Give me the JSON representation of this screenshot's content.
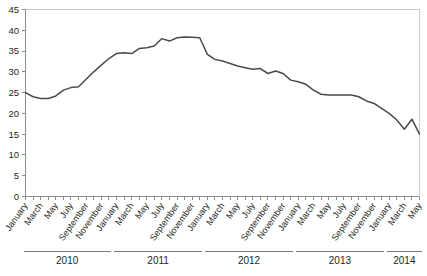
{
  "chart_data": {
    "type": "line",
    "title": "",
    "subtitle": "",
    "xlabel": "",
    "ylabel": "",
    "ylim": [
      0,
      45
    ],
    "grid": false,
    "legend": null,
    "line_color": "#4a4a4a",
    "axis_color": "#8d8d8d",
    "y_ticks": [
      0,
      5,
      10,
      15,
      20,
      25,
      30,
      35,
      40,
      45
    ],
    "x_tick_labels": [
      "January",
      "March",
      "May",
      "July",
      "September",
      "November",
      "January",
      "March",
      "May",
      "July",
      "September",
      "November",
      "January",
      "March",
      "May",
      "July",
      "September",
      "November",
      "January",
      "March",
      "May",
      "July",
      "September",
      "November",
      "January",
      "March",
      "May"
    ],
    "year_groups": [
      {
        "label": "2010",
        "start_index": 0,
        "end_index": 11
      },
      {
        "label": "2011",
        "start_index": 12,
        "end_index": 23
      },
      {
        "label": "2012",
        "start_index": 24,
        "end_index": 35
      },
      {
        "label": "2013",
        "start_index": 36,
        "end_index": 47
      },
      {
        "label": "2014",
        "start_index": 48,
        "end_index": 52
      }
    ],
    "x": [
      "2010-01",
      "2010-02",
      "2010-03",
      "2010-04",
      "2010-05",
      "2010-06",
      "2010-07",
      "2010-08",
      "2010-09",
      "2010-10",
      "2010-11",
      "2010-12",
      "2011-01",
      "2011-02",
      "2011-03",
      "2011-04",
      "2011-05",
      "2011-06",
      "2011-07",
      "2011-08",
      "2011-09",
      "2011-10",
      "2011-11",
      "2011-12",
      "2012-01",
      "2012-02",
      "2012-03",
      "2012-04",
      "2012-05",
      "2012-06",
      "2012-07",
      "2012-08",
      "2012-09",
      "2012-10",
      "2012-11",
      "2012-12",
      "2013-01",
      "2013-02",
      "2013-03",
      "2013-04",
      "2013-05",
      "2013-06",
      "2013-07",
      "2013-08",
      "2013-09",
      "2013-10",
      "2013-11",
      "2013-12",
      "2014-01",
      "2014-02",
      "2014-03",
      "2014-04",
      "2014-05"
    ],
    "values": [
      25.0,
      24.0,
      23.6,
      23.6,
      24.2,
      25.6,
      26.2,
      26.4,
      28.2,
      30.0,
      31.6,
      33.2,
      34.4,
      34.6,
      34.4,
      35.6,
      35.8,
      36.2,
      38.0,
      37.4,
      38.2,
      38.4,
      38.3,
      38.2,
      34.2,
      33.0,
      32.6,
      32.0,
      31.4,
      31.0,
      30.6,
      30.8,
      29.6,
      30.2,
      29.6,
      28.0,
      27.6,
      27.0,
      25.6,
      24.6,
      24.4,
      24.4,
      24.4,
      24.4,
      24.0,
      23.0,
      22.4,
      21.2,
      20.0,
      18.4,
      16.2,
      18.6,
      15.0
    ],
    "values_extended_note": "monthly series"
  },
  "meta": {
    "y_axis_max_label": "45",
    "y_axis_min_label": "0"
  }
}
